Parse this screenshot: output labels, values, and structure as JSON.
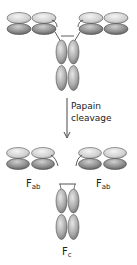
{
  "diagram": {
    "arrow_label_line1": "Papain",
    "arrow_label_line2": "cleavage",
    "fab_left_label_main": "F",
    "fab_left_label_sub": "ab",
    "fab_right_label_main": "F",
    "fab_right_label_sub": "ab",
    "fc_label_main": "F",
    "fc_label_sub": "c"
  },
  "colors": {
    "light_domain": "#d9d9d9",
    "dark_domain": "#8f8f8f",
    "outline": "#4a4a4a",
    "arrow": "#333333",
    "text": "#222222"
  }
}
